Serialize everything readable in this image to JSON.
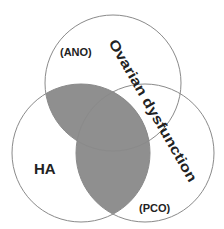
{
  "diagram": {
    "type": "venn",
    "sets": [
      {
        "id": "top",
        "name": "Ovarian dysfunction",
        "sublabel": "(ANO)",
        "cx": 113,
        "cy": 83,
        "r": 68
      },
      {
        "id": "left",
        "name": "HA",
        "cx": 81,
        "cy": 153,
        "r": 69
      },
      {
        "id": "right",
        "name": "(PCO)",
        "cx": 145,
        "cy": 153,
        "r": 69
      }
    ],
    "shaded_regions": [
      "top∩left",
      "left∩right"
    ],
    "colors": {
      "shade": "#8f8f8f",
      "stroke": "#8a8a8a",
      "text": "#222222",
      "background": "#ffffff"
    }
  },
  "labels": {
    "ano": "(ANO)",
    "ha": "HA",
    "pco": "(PCO)",
    "ovarian": "Ovarian dysfunction"
  }
}
